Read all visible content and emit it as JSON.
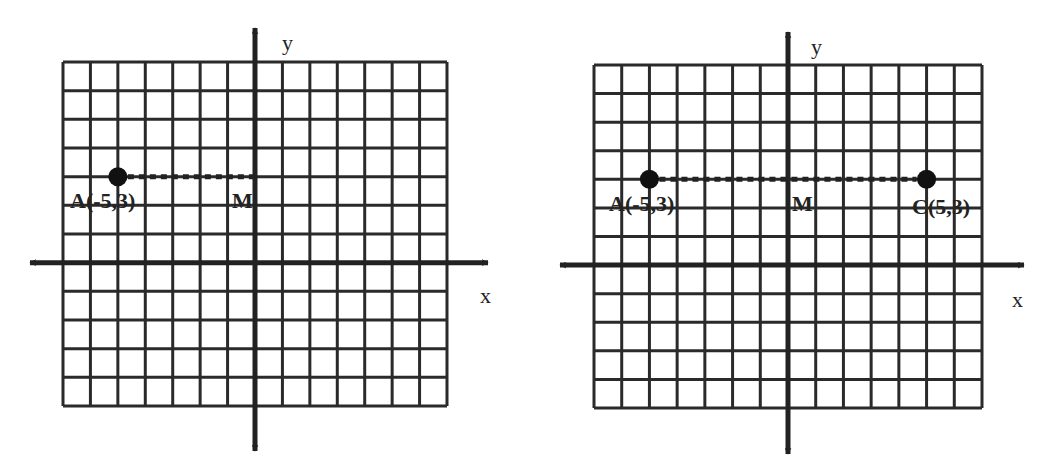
{
  "chart_data": [
    {
      "type": "scatter",
      "title": "",
      "xlabel": "x",
      "ylabel": "y",
      "grid": true,
      "xlim": [
        -7,
        7
      ],
      "ylim": [
        -5,
        7
      ],
      "points": [
        {
          "name": "A",
          "x": -5,
          "y": 3,
          "label": "A(-5,3)",
          "marker": "dot"
        },
        {
          "name": "M",
          "x": 0,
          "y": 3,
          "label": "M",
          "marker": "none"
        }
      ],
      "segments": [
        {
          "from": "A",
          "to": "M",
          "style": "dotted"
        }
      ]
    },
    {
      "type": "scatter",
      "title": "",
      "xlabel": "x",
      "ylabel": "y",
      "grid": true,
      "xlim": [
        -7,
        7
      ],
      "ylim": [
        -5,
        7
      ],
      "points": [
        {
          "name": "A",
          "x": -5,
          "y": 3,
          "label": "A(-5,3)",
          "marker": "dot"
        },
        {
          "name": "M",
          "x": 0,
          "y": 3,
          "label": "M",
          "marker": "none"
        },
        {
          "name": "C",
          "x": 5,
          "y": 3,
          "label": "C(5,3)",
          "marker": "dot"
        }
      ],
      "segments": [
        {
          "from": "A",
          "to": "C",
          "style": "dotted"
        }
      ]
    }
  ],
  "graphs": [
    {
      "axis_labels": {
        "x": "x",
        "y": "y"
      },
      "labels": {
        "a": "A(-5,3)",
        "m": "M"
      }
    },
    {
      "axis_labels": {
        "x": "x",
        "y": "y"
      },
      "labels": {
        "a": "A(-5,3)",
        "m": "M",
        "c": "C(5,3)"
      }
    }
  ]
}
